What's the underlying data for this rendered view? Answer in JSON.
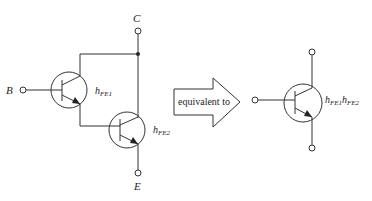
{
  "diagram": {
    "terminals": {
      "base": "B",
      "collector": "C",
      "emitter": "E"
    },
    "transistors": [
      {
        "id": "Q1",
        "gain_symbol": "h",
        "gain_sub": "FE1"
      },
      {
        "id": "Q2",
        "gain_symbol": "h",
        "gain_sub": "FE2"
      }
    ],
    "arrow_label": "equivalent to",
    "equivalent": {
      "gain_parts": [
        {
          "symbol": "h",
          "sub": "FE1"
        },
        {
          "symbol": "h",
          "sub": "FE2"
        }
      ]
    },
    "colors": {
      "line": "#333333",
      "text": "#222222",
      "background": "#ffffff"
    }
  }
}
